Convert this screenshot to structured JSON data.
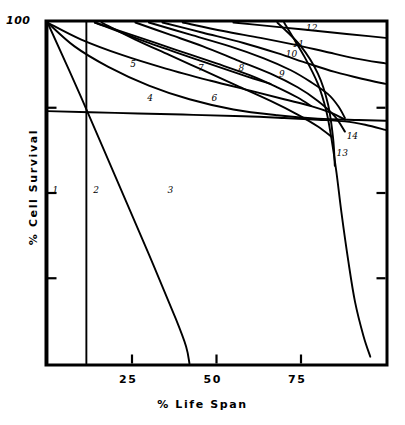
{
  "chart_data": {
    "type": "line",
    "title": "",
    "xlabel": "% Life Span",
    "ylabel": "% Cell Survival",
    "xlim": [
      0,
      100
    ],
    "ylim": [
      0,
      100
    ],
    "grid": false,
    "legend": "inline-curve-labels",
    "xticks": [
      {
        "value": 25,
        "label": "25"
      },
      {
        "value": 50,
        "label": "50"
      },
      {
        "value": 75,
        "label": "75"
      }
    ],
    "yticks": [
      {
        "value": 100,
        "label": "100"
      },
      {
        "value": 75,
        "label": ""
      },
      {
        "value": 50,
        "label": ""
      },
      {
        "value": 25,
        "label": ""
      }
    ],
    "series": [
      {
        "name": "1",
        "label": "1",
        "label_x": 1.5,
        "label_y": 50.5,
        "points": [
          [
            0,
            100
          ],
          [
            0,
            0
          ]
        ]
      },
      {
        "name": "2",
        "label": "2",
        "label_x": 13.5,
        "label_y": 50.5,
        "points": [
          [
            11.5,
            100
          ],
          [
            11.5,
            0
          ]
        ]
      },
      {
        "name": "3",
        "label": "3",
        "label_x": 35.5,
        "label_y": 50.5,
        "points": [
          [
            0,
            100
          ],
          [
            10,
            78
          ],
          [
            20,
            55
          ],
          [
            30,
            32
          ],
          [
            38,
            13
          ],
          [
            41,
            5
          ],
          [
            42,
            0
          ]
        ]
      },
      {
        "name": "4",
        "label": "4",
        "label_x": 29.5,
        "label_y": 77.5,
        "points": [
          [
            0,
            100
          ],
          [
            8,
            93
          ],
          [
            18,
            87
          ],
          [
            30,
            81.5
          ],
          [
            42,
            77.5
          ],
          [
            55,
            74.5
          ],
          [
            68,
            72.8
          ],
          [
            80,
            71.8
          ],
          [
            92,
            71.4
          ],
          [
            100,
            71.2
          ]
        ]
      },
      {
        "name": "5",
        "label": "5",
        "label_x": 24.5,
        "label_y": 87.5,
        "points": [
          [
            0,
            100
          ],
          [
            10,
            95
          ],
          [
            22,
            90.5
          ],
          [
            35,
            86.5
          ],
          [
            48,
            83
          ],
          [
            60,
            80
          ],
          [
            70,
            77.5
          ],
          [
            78,
            75.5
          ],
          [
            84,
            73.5
          ],
          [
            88,
            71.5
          ]
        ]
      },
      {
        "name": "6",
        "label": "6",
        "label_x": 48.5,
        "label_y": 77.5,
        "points": [
          [
            16,
            100
          ],
          [
            26,
            95
          ],
          [
            36,
            90.5
          ],
          [
            46,
            86
          ],
          [
            56,
            81.5
          ],
          [
            66,
            77
          ],
          [
            74,
            73
          ],
          [
            80,
            69.5
          ],
          [
            84,
            66.5
          ]
        ]
      },
      {
        "name": "7",
        "label": "7",
        "label_x": 44.5,
        "label_y": 86.5,
        "points": [
          [
            14,
            100
          ],
          [
            26,
            96
          ],
          [
            38,
            92
          ],
          [
            50,
            88
          ],
          [
            60,
            84.5
          ],
          [
            68,
            81
          ],
          [
            74,
            78
          ],
          [
            78,
            75.5
          ]
        ]
      },
      {
        "name": "8",
        "label": "8",
        "label_x": 56.5,
        "label_y": 86.5,
        "points": [
          [
            26,
            100
          ],
          [
            36,
            96.5
          ],
          [
            46,
            93
          ],
          [
            56,
            89
          ],
          [
            66,
            85
          ],
          [
            74,
            81
          ],
          [
            80,
            77
          ],
          [
            85,
            72.5
          ],
          [
            88,
            68
          ]
        ]
      },
      {
        "name": "9",
        "label": "9",
        "label_x": 68.5,
        "label_y": 84.5,
        "points": [
          [
            30,
            100
          ],
          [
            42,
            96.5
          ],
          [
            54,
            93
          ],
          [
            64,
            89.5
          ],
          [
            72,
            86
          ],
          [
            78,
            82.5
          ],
          [
            83,
            79
          ],
          [
            86,
            75.5
          ],
          [
            88,
            72
          ]
        ]
      },
      {
        "name": "10",
        "label": "10",
        "label_x": 70.5,
        "label_y": 90.5,
        "points": [
          [
            34,
            100
          ],
          [
            46,
            97
          ],
          [
            58,
            94
          ],
          [
            68,
            91
          ],
          [
            77,
            88
          ],
          [
            85,
            85.5
          ],
          [
            93,
            83.5
          ],
          [
            100,
            82
          ]
        ]
      },
      {
        "name": "11",
        "label": "11",
        "label_x": 72.5,
        "label_y": 93.5,
        "points": [
          [
            40,
            100
          ],
          [
            52,
            97.5
          ],
          [
            63,
            95.5
          ],
          [
            73,
            93.5
          ],
          [
            82,
            91.5
          ],
          [
            91,
            89.5
          ],
          [
            100,
            88
          ]
        ]
      },
      {
        "name": "12",
        "label": "12",
        "label_x": 76.5,
        "label_y": 98,
        "points": [
          [
            55,
            100
          ],
          [
            65,
            99
          ],
          [
            75,
            98
          ],
          [
            85,
            97
          ],
          [
            95,
            96
          ],
          [
            100,
            95.5
          ]
        ]
      },
      {
        "name": "13",
        "label": "13",
        "label_x": 85.5,
        "label_y": 61.5,
        "points": [
          [
            70,
            100
          ],
          [
            76,
            90
          ],
          [
            80,
            82
          ],
          [
            82.5,
            74
          ],
          [
            84,
            66
          ],
          [
            85.5,
            56
          ],
          [
            87,
            44
          ],
          [
            89,
            30
          ],
          [
            91,
            18
          ],
          [
            93.5,
            8
          ],
          [
            95.5,
            2
          ]
        ]
      },
      {
        "name": "14",
        "label": "14",
        "label_x": 88.5,
        "label_y": 66.5,
        "points": [
          [
            0,
            74
          ],
          [
            20,
            73.5
          ],
          [
            40,
            73
          ],
          [
            58,
            72.5
          ],
          [
            70,
            72
          ],
          [
            80,
            71.5
          ],
          [
            88,
            71
          ],
          [
            94,
            70
          ],
          [
            100,
            68.5
          ]
        ]
      }
    ],
    "extra_strokes": [
      {
        "name": "tail-7",
        "points": [
          [
            14,
            100
          ],
          [
            30,
            94
          ],
          [
            46,
            88.5
          ],
          [
            58,
            84.5
          ],
          [
            66,
            82
          ]
        ]
      },
      {
        "name": "tail-6b",
        "points": [
          [
            68,
            100
          ],
          [
            75,
            93
          ],
          [
            80,
            85
          ],
          [
            83,
            76
          ],
          [
            84.5,
            66
          ],
          [
            85,
            58
          ]
        ]
      }
    ]
  }
}
